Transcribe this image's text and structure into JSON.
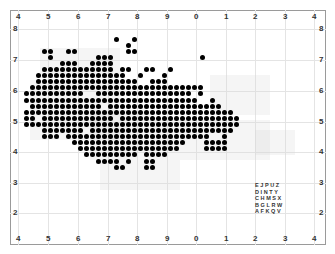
{
  "map": {
    "type": "grid-square distribution dot map",
    "x_labels": [
      "4",
      "5",
      "6",
      "7",
      "8",
      "9",
      "0",
      "1",
      "2",
      "3",
      "4"
    ],
    "y_labels": [
      "8",
      "7",
      "6",
      "5",
      "4",
      "3",
      "2"
    ],
    "legend_rows": [
      "EJPUZ",
      "DINTY",
      "CHMSX",
      "BGLRW",
      "AFKQV"
    ],
    "colors": {
      "dot": "#000000",
      "frame": "#9a9a9a",
      "grid": "#e4e4e4",
      "shade": "#d6d6d6",
      "label": "#333333"
    }
  },
  "grid": {
    "x0": 26,
    "y0": 39,
    "pitch_x": 6,
    "pitch_y": 6.1,
    "rows": [
      "               *  *          ",
      "                 *           ",
      "   **  **        **          ",
      "    *       ***              ",
      "      ***  ****               ",
      "   ************ **  **  *     ",
      "  ***************  *   *     ",
      "  *****************  ***     ",
      " *****************************  ",
      "**********  **************** *   ",
      "*****************************  *  ",
      " ************ ******************* ",
      "*********************************** ",
      "** ************ ******************** ",
      "************************************ ",
      "   ******* ************************  ",
      "   *** ************************  *   ",
      "        *******************   ****   ",
      "         *****************    ****   ",
      "          ********* ****             ",
      "            **** *  **               ",
      "               **   **               "
    ]
  }
}
